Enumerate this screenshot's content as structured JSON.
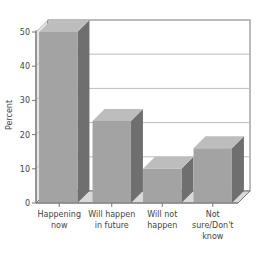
{
  "chart_data": {
    "type": "bar",
    "style": "3d",
    "title": "",
    "xlabel": "",
    "ylabel": "Percent",
    "ylim": [
      0,
      50
    ],
    "yticks": [
      0,
      10,
      20,
      30,
      40,
      50
    ],
    "grid": true,
    "legend": null,
    "categories": [
      [
        "Happening",
        "now"
      ],
      [
        "Will happen",
        "in future"
      ],
      [
        "Will not",
        "happen"
      ],
      [
        "Not",
        "sure/Don't",
        "know"
      ]
    ],
    "category_names": [
      "Happening now",
      "Will happen in future",
      "Will not happen",
      "Not sure/Don't know"
    ],
    "values": [
      50,
      24,
      10,
      16
    ]
  },
  "colors": {
    "bar_front": "#a3a3a3",
    "bar_top": "#bdbdbd",
    "bar_side": "#6f6f6f",
    "wall": "#ffffff",
    "wall_left": "#e6e6e6",
    "floor": "#d9d9d9",
    "grid": "#bcbcbc",
    "axis": "#777777",
    "text": "#444444"
  }
}
